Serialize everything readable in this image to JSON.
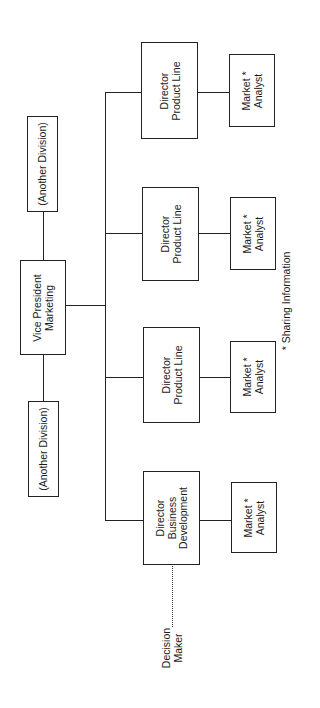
{
  "diagram": {
    "type": "org-chart",
    "orientation": "rotated-90-ccw",
    "top_node": {
      "line1": "Vice President",
      "line2": "Marketing"
    },
    "peers": [
      {
        "label": "(Another Division)"
      },
      {
        "label": "(Another Division)"
      }
    ],
    "directors": [
      {
        "line1": "Director",
        "line2": "Product Line",
        "line3": ""
      },
      {
        "line1": "Director",
        "line2": "Product Line",
        "line3": ""
      },
      {
        "line1": "Director",
        "line2": "Product Line",
        "line3": ""
      },
      {
        "line1": "Director",
        "line2": "Business",
        "line3": "Development"
      }
    ],
    "analysts": [
      {
        "line1": "Market *",
        "line2": "Analyst"
      },
      {
        "line1": "Market *",
        "line2": "Analyst"
      },
      {
        "line1": "Market *",
        "line2": "Analyst"
      },
      {
        "line1": "Market *",
        "line2": "Analyst"
      }
    ],
    "decision_maker": {
      "line1": "Decision",
      "line2": "Maker"
    },
    "footnote": "* Sharing Information",
    "colors": {
      "line": "#222222",
      "background": "#ffffff",
      "text": "#1a1a1a"
    }
  }
}
